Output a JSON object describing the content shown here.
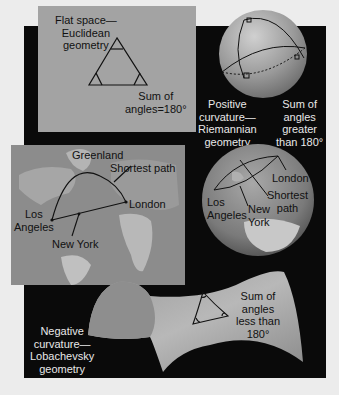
{
  "euclidean": {
    "title_line1": "Flat space—",
    "title_line2": "Euclidean",
    "title_line3": "geometry",
    "sum_line1": "Sum of",
    "sum_line2": "angles=180°"
  },
  "riemannian": {
    "title_line1": "Positive",
    "title_line2": "curvature—",
    "title_line3": "Riemannian",
    "title_line4": "geometry",
    "sum_line1": "Sum of",
    "sum_line2": "angles",
    "sum_line3": "greater",
    "sum_line4": "than 180°"
  },
  "flat_map": {
    "greenland": "Greenland",
    "shortest_path": "Shortest path",
    "los": "Los",
    "angeles": "Angeles",
    "london": "London",
    "new_york": "New York"
  },
  "globe": {
    "london": "London",
    "los": "Los",
    "angeles": "Angeles",
    "new": "New",
    "york": "York",
    "shortest": "Shortest",
    "path": "path"
  },
  "lobachevsky": {
    "title_line1": "Negative",
    "title_line2": "curvature—",
    "title_line3": "Lobachevsky",
    "title_line4": "geometry",
    "sum_line1": "Sum of",
    "sum_line2": "angles",
    "sum_line3": "less than",
    "sum_line4": "180°"
  },
  "colors": {
    "background": "#ececec",
    "panel_black": "#0a0a0a",
    "flat_panel": "#a3a3a3",
    "sphere": "#9a9a9a",
    "saddle": "#a8a8a8"
  }
}
